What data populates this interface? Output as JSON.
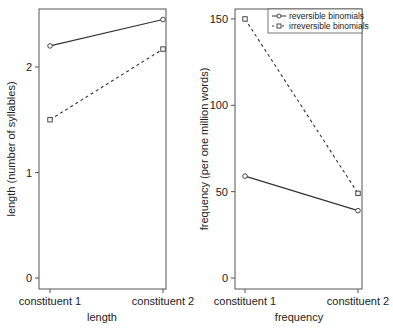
{
  "chart_data": [
    {
      "type": "line",
      "title": "",
      "xlabel": "length",
      "ylabel": "length (number of syllables)",
      "categories": [
        "constituent 1",
        "constituent 2"
      ],
      "yticks": [
        0,
        1,
        2
      ],
      "ylim": [
        -0.1,
        2.55
      ],
      "grid": false,
      "series": [
        {
          "name": "reversible binomials",
          "values": [
            2.2,
            2.45
          ],
          "marker": "circle",
          "linestyle": "solid"
        },
        {
          "name": "irreversible binomials",
          "values": [
            1.5,
            2.17
          ],
          "marker": "square",
          "linestyle": "dashed"
        }
      ]
    },
    {
      "type": "line",
      "title": "",
      "xlabel": "frequency",
      "ylabel": "frequency (per one million words)",
      "categories": [
        "constituent 1",
        "constituent 2"
      ],
      "yticks": [
        0,
        50,
        100,
        150
      ],
      "ylim": [
        -6,
        156
      ],
      "grid": false,
      "legend_position": "top-right",
      "series": [
        {
          "name": "reversible binomials",
          "values": [
            59,
            39
          ],
          "marker": "circle",
          "linestyle": "solid"
        },
        {
          "name": "irreversible binomials",
          "values": [
            150,
            49
          ],
          "marker": "square",
          "linestyle": "dashed"
        }
      ]
    }
  ],
  "legend": {
    "items": [
      {
        "label": "reversible binomials"
      },
      {
        "label": "irreversible binomials"
      }
    ]
  },
  "colors": {
    "line": "#333333",
    "frame": "#555555",
    "text": "#222222"
  }
}
